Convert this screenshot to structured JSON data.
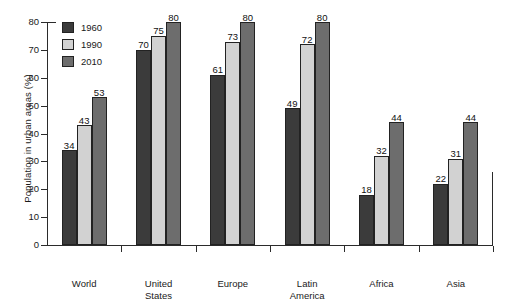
{
  "chart_data": {
    "type": "bar",
    "title": "",
    "xlabel": "",
    "ylabel": "Population in urban areas (%)",
    "ylim": [
      0,
      80
    ],
    "yticks": [
      0,
      10,
      20,
      30,
      40,
      50,
      60,
      70,
      80
    ],
    "grid": false,
    "legend_position": "top-left",
    "categories": [
      "World",
      "United States",
      "Europe",
      "Latin America",
      "Africa",
      "Asia"
    ],
    "category_lines": [
      [
        "World"
      ],
      [
        "United",
        "States"
      ],
      [
        "Europe"
      ],
      [
        "Latin",
        "America"
      ],
      [
        "Africa"
      ],
      [
        "Asia"
      ]
    ],
    "series": [
      {
        "name": "1960",
        "color": "#3b3b3b",
        "values": [
          34,
          70,
          61,
          49,
          18,
          22
        ]
      },
      {
        "name": "1990",
        "color": "#d2d2d2",
        "values": [
          43,
          75,
          73,
          72,
          32,
          31
        ]
      },
      {
        "name": "2010",
        "color": "#6d6d6d",
        "values": [
          53,
          80,
          80,
          80,
          44,
          44
        ]
      }
    ],
    "value_labels_shown": true
  },
  "axis": {
    "tick_labels": [
      "0",
      "10",
      "20",
      "30",
      "40",
      "50",
      "60",
      "70",
      "80"
    ]
  },
  "legend": {
    "items": [
      {
        "label": "1960"
      },
      {
        "label": "1990"
      },
      {
        "label": "2010"
      }
    ]
  },
  "colors": {
    "series_1960": "#3b3b3b",
    "series_1990": "#d2d2d2",
    "series_2010": "#6d6d6d",
    "axis": "#2b2b2b",
    "background": "#ffffff",
    "text": "#1a1a1a"
  }
}
